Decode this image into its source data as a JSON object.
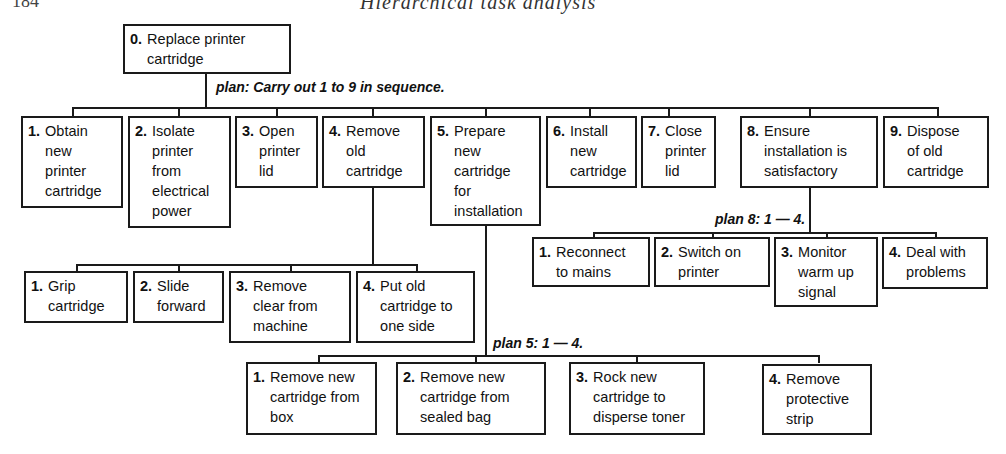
{
  "header": {
    "page": "184",
    "title": "Hierarchical task analysis"
  },
  "root": {
    "num": "0.",
    "label": "Replace printer\ncartridge"
  },
  "plan_0": "plan: Carry out 1 to 9 in sequence.",
  "tasks": [
    {
      "num": "1.",
      "label": "Obtain\nnew\nprinter\ncartridge"
    },
    {
      "num": "2.",
      "label": "Isolate\nprinter\nfrom\nelectrical\npower"
    },
    {
      "num": "3.",
      "label": "Open\nprinter\nlid"
    },
    {
      "num": "4.",
      "label": "Remove\nold\ncartridge"
    },
    {
      "num": "5.",
      "label": "Prepare\nnew\ncartridge\nfor\ninstallation"
    },
    {
      "num": "6.",
      "label": "Install\nnew\ncartridge"
    },
    {
      "num": "7.",
      "label": "Close\nprinter\nlid"
    },
    {
      "num": "8.",
      "label": "Ensure\ninstallation is\nsatisfactory"
    },
    {
      "num": "9.",
      "label": "Dispose\nof old\ncartridge"
    }
  ],
  "task4_subtasks": [
    {
      "num": "1.",
      "label": "Grip\ncartridge"
    },
    {
      "num": "2.",
      "label": "Slide\nforward"
    },
    {
      "num": "3.",
      "label": "Remove\nclear from\nmachine"
    },
    {
      "num": "4.",
      "label": "Put old\ncartridge to\none side"
    }
  ],
  "plan_5": "plan 5: 1 — 4.",
  "task5_subtasks": [
    {
      "num": "1.",
      "label": "Remove new\ncartridge from\nbox"
    },
    {
      "num": "2.",
      "label": "Remove new\ncartridge from\nsealed bag"
    },
    {
      "num": "3.",
      "label": "Rock new\ncartridge to\ndisperse toner"
    },
    {
      "num": "4.",
      "label": "Remove\nprotective\nstrip"
    }
  ],
  "plan_8": "plan 8: 1 — 4.",
  "task8_subtasks": [
    {
      "num": "1.",
      "label": "Reconnect\nto mains"
    },
    {
      "num": "2.",
      "label": "Switch on\nprinter"
    },
    {
      "num": "3.",
      "label": "Monitor\nwarm up\nsignal"
    },
    {
      "num": "4.",
      "label": "Deal with\nproblems"
    }
  ]
}
